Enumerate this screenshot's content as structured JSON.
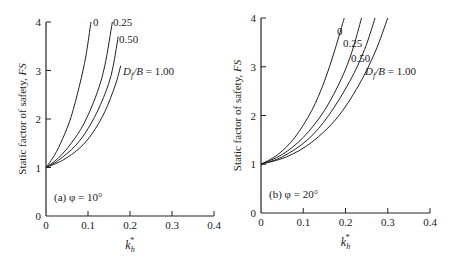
{
  "chart_data": [
    {
      "type": "line",
      "panel_label": "(a) φ = 10°",
      "xlabel": "k_h*",
      "ylabel": "Static factor of safety, FS",
      "xlim": [
        0,
        0.4
      ],
      "ylim": [
        0,
        4
      ],
      "xticks": [
        "0",
        "0.1",
        "0.2",
        "0.3",
        "0.4"
      ],
      "yticks": [
        "0",
        "1",
        "2",
        "3",
        "4"
      ],
      "grid": false,
      "series": [
        {
          "name": "0",
          "label": "0",
          "x": [
            0,
            0.02,
            0.04,
            0.06,
            0.08,
            0.095,
            0.107
          ],
          "y": [
            1.0,
            1.25,
            1.6,
            2.05,
            2.7,
            3.3,
            4.0
          ]
        },
        {
          "name": "0.25",
          "label": "0.25",
          "x": [
            0,
            0.03,
            0.06,
            0.09,
            0.12,
            0.14,
            0.158
          ],
          "y": [
            1.0,
            1.2,
            1.5,
            1.9,
            2.5,
            3.1,
            4.0
          ]
        },
        {
          "name": "0.50",
          "label": "0.50",
          "x": [
            0,
            0.03,
            0.07,
            0.1,
            0.13,
            0.155,
            0.172
          ],
          "y": [
            1.0,
            1.15,
            1.45,
            1.8,
            2.3,
            2.9,
            3.7
          ]
        },
        {
          "name": "1.00",
          "label": "Df/B = 1.00",
          "x": [
            0,
            0.04,
            0.08,
            0.11,
            0.14,
            0.165,
            0.178
          ],
          "y": [
            1.0,
            1.15,
            1.4,
            1.7,
            2.15,
            2.7,
            3.1
          ]
        }
      ]
    },
    {
      "type": "line",
      "panel_label": "(b) φ = 20°",
      "xlabel": "k_h*",
      "ylabel": "Static factor of safety, FS",
      "xlim": [
        0,
        0.4
      ],
      "ylim": [
        0,
        4
      ],
      "xticks": [
        "0",
        "0.1",
        "0.2",
        "0.3",
        "0.4"
      ],
      "yticks": [
        "0",
        "1",
        "2",
        "3",
        "4"
      ],
      "grid": false,
      "series": [
        {
          "name": "0",
          "label": "0",
          "x": [
            0,
            0.04,
            0.08,
            0.12,
            0.15,
            0.175,
            0.197
          ],
          "y": [
            1.0,
            1.2,
            1.55,
            2.1,
            2.7,
            3.35,
            4.0
          ]
        },
        {
          "name": "0.25",
          "label": "0.25",
          "x": [
            0,
            0.05,
            0.1,
            0.15,
            0.19,
            0.215,
            0.238
          ],
          "y": [
            1.0,
            1.2,
            1.55,
            2.1,
            2.75,
            3.3,
            4.0
          ]
        },
        {
          "name": "0.50",
          "label": "0.50",
          "x": [
            0,
            0.05,
            0.11,
            0.16,
            0.21,
            0.245,
            0.27
          ],
          "y": [
            1.0,
            1.15,
            1.5,
            2.0,
            2.7,
            3.35,
            4.0
          ]
        },
        {
          "name": "1.00",
          "label": "Df/B = 1.00",
          "x": [
            0,
            0.06,
            0.12,
            0.18,
            0.23,
            0.27,
            0.3
          ],
          "y": [
            1.0,
            1.15,
            1.45,
            1.95,
            2.6,
            3.3,
            4.0
          ]
        }
      ]
    }
  ],
  "panels": [
    {
      "id": "a",
      "px": {
        "x0": 46,
        "x1": 214,
        "y0": 216,
        "y4": 22
      },
      "curve_label_pos": [
        [
          93,
          26
        ],
        [
          113,
          26
        ],
        [
          119,
          43
        ],
        [
          123,
          75
        ]
      ]
    },
    {
      "id": "b",
      "px": {
        "x0": 261,
        "x1": 430,
        "y0": 213,
        "y4": 18
      },
      "curve_label_pos": [
        [
          337,
          35
        ],
        [
          343,
          47
        ],
        [
          351,
          62
        ],
        [
          365,
          75
        ]
      ]
    }
  ]
}
